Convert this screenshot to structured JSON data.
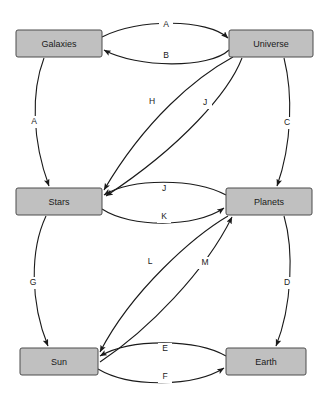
{
  "diagram": {
    "type": "directed-graph",
    "background_color": "#ffffff",
    "node_fill_color": "#c0c0c0",
    "node_stroke_color": "#4d4d4d",
    "edge_color": "#1a1a1a",
    "nodes": [
      {
        "id": "galaxies",
        "label": "Galaxies",
        "x": 16,
        "y": 30,
        "w": 86,
        "h": 27
      },
      {
        "id": "universe",
        "label": "Universe",
        "x": 229,
        "y": 30,
        "w": 84,
        "h": 27
      },
      {
        "id": "stars",
        "label": "Stars",
        "x": 16,
        "y": 188,
        "w": 86,
        "h": 27
      },
      {
        "id": "planets",
        "label": "Planets",
        "x": 226,
        "y": 188,
        "w": 86,
        "h": 27
      },
      {
        "id": "sun",
        "label": "Sun",
        "x": 20,
        "y": 348,
        "w": 78,
        "h": 27
      },
      {
        "id": "earth",
        "label": "Earth",
        "x": 226,
        "y": 348,
        "w": 80,
        "h": 27
      }
    ],
    "edges": [
      {
        "id": "e-a-top",
        "label": "A",
        "from": "galaxies",
        "to": "universe",
        "label_x": 166,
        "label_y": 25
      },
      {
        "id": "e-b",
        "label": "B",
        "from": "universe",
        "to": "galaxies",
        "label_x": 166,
        "label_y": 56
      },
      {
        "id": "e-a-left",
        "label": "A",
        "from": "galaxies",
        "to": "stars",
        "label_x": 34,
        "label_y": 122
      },
      {
        "id": "e-h",
        "label": "H",
        "from": "universe",
        "to": "stars",
        "label_x": 152,
        "label_y": 102
      },
      {
        "id": "e-j-diag",
        "label": "J",
        "from": "universe",
        "to": "stars",
        "label_x": 205,
        "label_y": 103
      },
      {
        "id": "e-c",
        "label": "C",
        "from": "universe",
        "to": "planets",
        "label_x": 287,
        "label_y": 123
      },
      {
        "id": "e-j-mid",
        "label": "J",
        "from": "planets",
        "to": "stars",
        "label_x": 164,
        "label_y": 189
      },
      {
        "id": "e-k",
        "label": "K",
        "from": "stars",
        "to": "planets",
        "label_x": 164,
        "label_y": 217
      },
      {
        "id": "e-g",
        "label": "G",
        "from": "stars",
        "to": "sun",
        "label_x": 33,
        "label_y": 283
      },
      {
        "id": "e-l",
        "label": "L",
        "from": "planets",
        "to": "sun",
        "label_x": 150,
        "label_y": 262
      },
      {
        "id": "e-m",
        "label": "M",
        "from": "sun",
        "to": "planets",
        "label_x": 205,
        "label_y": 263
      },
      {
        "id": "e-d",
        "label": "D",
        "from": "planets",
        "to": "earth",
        "label_x": 287,
        "label_y": 283
      },
      {
        "id": "e-e",
        "label": "E",
        "from": "earth",
        "to": "sun",
        "label_x": 165,
        "label_y": 349
      },
      {
        "id": "e-f",
        "label": "F",
        "from": "sun",
        "to": "earth",
        "label_x": 165,
        "label_y": 377
      }
    ]
  }
}
